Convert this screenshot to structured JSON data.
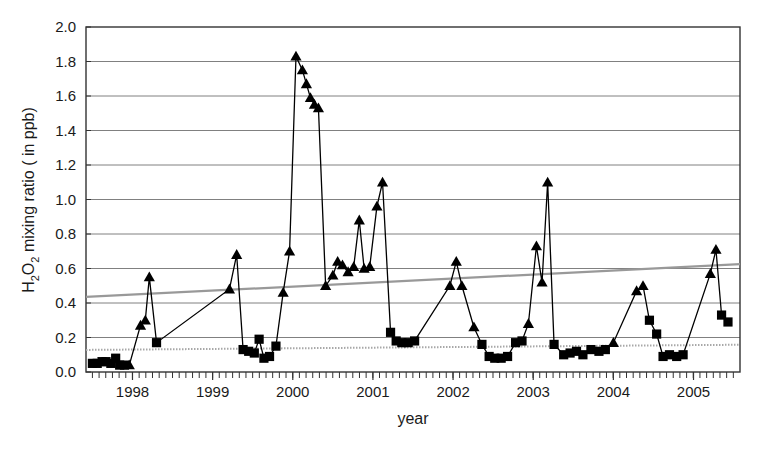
{
  "chart_data": {
    "type": "line",
    "title": "",
    "xlabel": "year",
    "ylabel": "H₂O₂ mixing ratio ( in ppb)",
    "ylabel_parts": {
      "pre": "H",
      "sub1": "2",
      "mid": "O",
      "sub2": "2",
      "post": " mixing ratio ( in ppb)"
    },
    "xlim": [
      1997.42,
      2005.58
    ],
    "ylim": [
      0.0,
      2.0
    ],
    "grid": true,
    "grid_axis": "y",
    "legend": "none",
    "yticks": [
      "0.0",
      "0.2",
      "0.4",
      "0.6",
      "0.8",
      "1.0",
      "1.2",
      "1.4",
      "1.6",
      "1.8",
      "2.0"
    ],
    "ytick_values": [
      0.0,
      0.2,
      0.4,
      0.6,
      0.8,
      1.0,
      1.2,
      1.4,
      1.6,
      1.8,
      2.0
    ],
    "xticks": [
      "1998",
      "1999",
      "2000",
      "2001",
      "2002",
      "2003",
      "2004",
      "2005"
    ],
    "xtick_values": [
      1998,
      1999,
      2000,
      2001,
      2002,
      2003,
      2004,
      2005
    ],
    "x_minor_tick_interval": 0.0833,
    "colors": {
      "marker": "#000000",
      "line": "#000000",
      "grid": "#808080",
      "axis": "#333333",
      "trend_upper": "#999999",
      "trend_lower": "#a8a8a8"
    },
    "series": [
      {
        "name": "H2O2 summer maxima",
        "marker": "triangle",
        "color": "#000000",
        "points": [
          [
            1997.96,
            0.04
          ],
          [
            1998.1,
            0.27
          ],
          [
            1998.16,
            0.3
          ],
          [
            1998.21,
            0.55
          ],
          [
            1999.21,
            0.48
          ],
          [
            1999.3,
            0.68
          ],
          [
            1999.88,
            0.46
          ],
          [
            1999.96,
            0.7
          ],
          [
            2000.04,
            1.83
          ],
          [
            2000.12,
            1.75
          ],
          [
            2000.17,
            1.67
          ],
          [
            2000.22,
            1.59
          ],
          [
            2000.27,
            1.55
          ],
          [
            2000.32,
            1.53
          ],
          [
            2000.41,
            0.5
          ],
          [
            2000.5,
            0.56
          ],
          [
            2000.56,
            0.64
          ],
          [
            2000.62,
            0.62
          ],
          [
            2000.69,
            0.58
          ],
          [
            2000.76,
            0.61
          ],
          [
            2000.83,
            0.88
          ],
          [
            2000.89,
            0.6
          ],
          [
            2000.96,
            0.61
          ],
          [
            2001.05,
            0.96
          ],
          [
            2001.12,
            1.1
          ],
          [
            2001.96,
            0.5
          ],
          [
            2002.04,
            0.64
          ],
          [
            2002.11,
            0.5
          ],
          [
            2002.26,
            0.26
          ],
          [
            2002.94,
            0.28
          ],
          [
            2003.04,
            0.73
          ],
          [
            2003.11,
            0.52
          ],
          [
            2003.18,
            1.1
          ],
          [
            2004.0,
            0.17
          ],
          [
            2004.29,
            0.47
          ],
          [
            2004.37,
            0.5
          ],
          [
            2005.21,
            0.57
          ],
          [
            2005.28,
            0.71
          ]
        ]
      },
      {
        "name": "H2O2 winter minima",
        "marker": "square",
        "color": "#000000",
        "points": [
          [
            1997.5,
            0.05
          ],
          [
            1997.56,
            0.05
          ],
          [
            1997.62,
            0.06
          ],
          [
            1997.67,
            0.06
          ],
          [
            1997.73,
            0.05
          ],
          [
            1997.79,
            0.08
          ],
          [
            1997.84,
            0.04
          ],
          [
            1997.9,
            0.04
          ],
          [
            1998.3,
            0.17
          ],
          [
            1999.38,
            0.13
          ],
          [
            1999.45,
            0.12
          ],
          [
            1999.52,
            0.11
          ],
          [
            1999.58,
            0.19
          ],
          [
            1999.64,
            0.08
          ],
          [
            1999.71,
            0.09
          ],
          [
            1999.79,
            0.15
          ],
          [
            2001.22,
            0.23
          ],
          [
            2001.29,
            0.18
          ],
          [
            2001.36,
            0.17
          ],
          [
            2001.44,
            0.17
          ],
          [
            2001.52,
            0.18
          ],
          [
            2002.36,
            0.16
          ],
          [
            2002.45,
            0.09
          ],
          [
            2002.52,
            0.08
          ],
          [
            2002.6,
            0.08
          ],
          [
            2002.68,
            0.09
          ],
          [
            2002.78,
            0.17
          ],
          [
            2002.86,
            0.18
          ],
          [
            2003.26,
            0.16
          ],
          [
            2003.38,
            0.1
          ],
          [
            2003.46,
            0.11
          ],
          [
            2003.54,
            0.12
          ],
          [
            2003.62,
            0.1
          ],
          [
            2003.72,
            0.13
          ],
          [
            2003.82,
            0.12
          ],
          [
            2003.9,
            0.13
          ],
          [
            2004.45,
            0.3
          ],
          [
            2004.54,
            0.22
          ],
          [
            2004.62,
            0.09
          ],
          [
            2004.7,
            0.1
          ],
          [
            2004.79,
            0.09
          ],
          [
            2004.87,
            0.1
          ],
          [
            2005.35,
            0.33
          ],
          [
            2005.43,
            0.29
          ]
        ]
      }
    ],
    "trendlines": [
      {
        "name": "upper-trend",
        "style": "solid",
        "color": "#999999",
        "x": [
          1997.42,
          2005.58
        ],
        "y": [
          0.435,
          0.625
        ]
      },
      {
        "name": "lower-trend",
        "style": "dotted",
        "color": "#a8a8a8",
        "x": [
          1997.42,
          2005.58
        ],
        "y": [
          0.128,
          0.158
        ]
      }
    ]
  }
}
